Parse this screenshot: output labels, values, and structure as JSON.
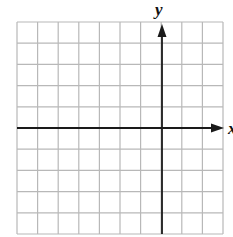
{
  "diagram": {
    "type": "coordinate-grid",
    "columns": 10,
    "rows": 10,
    "x_axis_label": "x",
    "y_axis_label": "y",
    "y_axis_column_index": 7,
    "x_axis_row_index": 5,
    "grid_color": "#b8b8b8",
    "axis_color": "#1a1a1a"
  }
}
